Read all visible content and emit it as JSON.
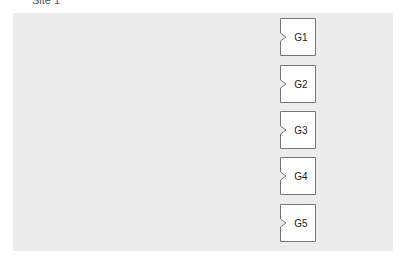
{
  "diagram": {
    "title": "Site 1",
    "panel_color": "#ececec",
    "gates": [
      {
        "label": "G1",
        "top": 18
      },
      {
        "label": "G2",
        "top": 65
      },
      {
        "label": "G3",
        "top": 111
      },
      {
        "label": "G4",
        "top": 157
      },
      {
        "label": "G5",
        "top": 204
      }
    ]
  }
}
